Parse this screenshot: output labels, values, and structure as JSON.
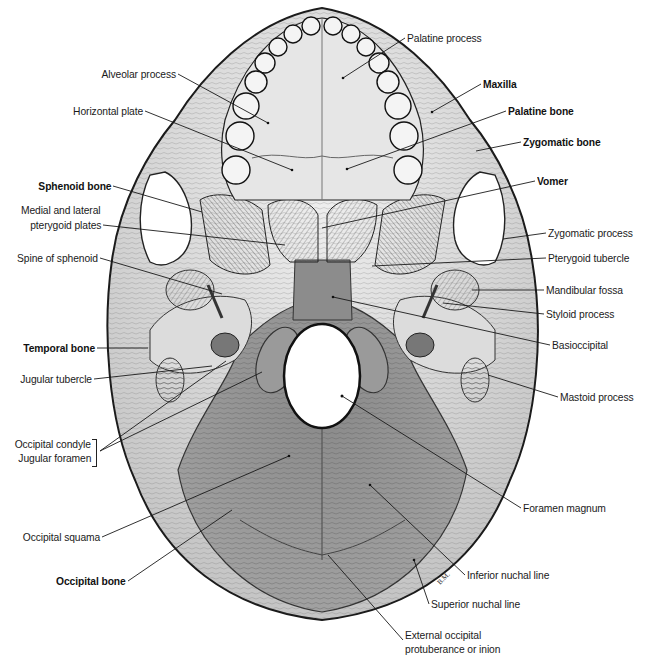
{
  "figure": {
    "signature": "B.M.",
    "colors": {
      "background": "#ffffff",
      "bone_light": "#e4e4e4",
      "bone_mid": "#bdbdbd",
      "occipital": "#8f8f8f",
      "ink": "#1a1a1a",
      "foramen": "#ffffff"
    }
  },
  "labels": {
    "left": [
      {
        "text": "Alveolar process",
        "bold": false,
        "x": 176,
        "y": 74,
        "tx": 268,
        "ty": 123
      },
      {
        "text": "Horizontal plate",
        "bold": false,
        "x": 143,
        "y": 111,
        "tx": 292,
        "ty": 170
      },
      {
        "text": "Sphenoid bone",
        "bold": true,
        "x": 111,
        "y": 186,
        "tx": 202,
        "ty": 212
      },
      {
        "text": "Medial and lateral",
        "bold": false,
        "x": 101,
        "y": 210,
        "tx": null,
        "ty": null
      },
      {
        "text": "pterygoid plates",
        "bold": false,
        "x": 101,
        "y": 225,
        "tx": 285,
        "ty": 245
      },
      {
        "text": "Spine of sphenoid",
        "bold": false,
        "x": 98,
        "y": 258,
        "tx": 222,
        "ty": 294
      },
      {
        "text": "Temporal bone",
        "bold": true,
        "x": 95,
        "y": 348,
        "tx": 148,
        "ty": 348
      },
      {
        "text": "Jugular tubercle",
        "bold": false,
        "x": 92,
        "y": 379,
        "tx": 212,
        "ty": 366
      },
      {
        "text": "Occipital condyle",
        "bold": false,
        "x": 91,
        "y": 444,
        "tx": 262,
        "ty": 372
      },
      {
        "text": "Jugular foramen",
        "bold": false,
        "x": 91,
        "y": 458,
        "tx": 226,
        "ty": 361
      },
      {
        "text": "Occipital squama",
        "bold": false,
        "x": 100,
        "y": 537,
        "tx": 289,
        "ty": 456
      },
      {
        "text": "Occipital bone",
        "bold": true,
        "x": 126,
        "y": 581,
        "tx": 232,
        "ty": 510
      }
    ],
    "right": [
      {
        "text": "Palatine process",
        "bold": false,
        "x": 407,
        "y": 38,
        "tx": 343,
        "ty": 78
      },
      {
        "text": "Maxilla",
        "bold": true,
        "x": 483,
        "y": 84,
        "tx": 432,
        "ty": 112
      },
      {
        "text": "Palatine bone",
        "bold": true,
        "x": 508,
        "y": 111,
        "tx": 347,
        "ty": 169
      },
      {
        "text": "Zygomatic bone",
        "bold": true,
        "x": 523,
        "y": 142,
        "tx": 476,
        "ty": 151
      },
      {
        "text": "Vomer",
        "bold": true,
        "x": 537,
        "y": 181,
        "tx": 322,
        "ty": 228
      },
      {
        "text": "Zygomatic process",
        "bold": false,
        "x": 548,
        "y": 233,
        "tx": 503,
        "ty": 239
      },
      {
        "text": "Pterygoid tubercle",
        "bold": false,
        "x": 548,
        "y": 258,
        "tx": 372,
        "ty": 266
      },
      {
        "text": "Mandibular fossa",
        "bold": false,
        "x": 546,
        "y": 290,
        "tx": 472,
        "ty": 290
      },
      {
        "text": "Styloid process",
        "bold": false,
        "x": 546,
        "y": 314,
        "tx": 443,
        "ty": 303
      },
      {
        "text": "Basioccipital",
        "bold": false,
        "x": 552,
        "y": 345,
        "tx": 333,
        "ty": 297
      },
      {
        "text": "Mastoid process",
        "bold": false,
        "x": 560,
        "y": 397,
        "tx": 488,
        "ty": 375
      },
      {
        "text": "Foramen magnum",
        "bold": false,
        "x": 523,
        "y": 508,
        "tx": 342,
        "ty": 396
      },
      {
        "text": "Inferior nuchal line",
        "bold": false,
        "x": 467,
        "y": 575,
        "tx": 370,
        "ty": 485
      },
      {
        "text": "Superior nuchal line",
        "bold": false,
        "x": 431,
        "y": 604,
        "tx": 414,
        "ty": 560
      },
      {
        "text": "External occipital",
        "bold": false,
        "x": 405,
        "y": 635,
        "tx": null,
        "ty": null
      },
      {
        "text": "protuberance or inion",
        "bold": false,
        "x": 405,
        "y": 649,
        "tx": 328,
        "ty": 555
      }
    ]
  }
}
